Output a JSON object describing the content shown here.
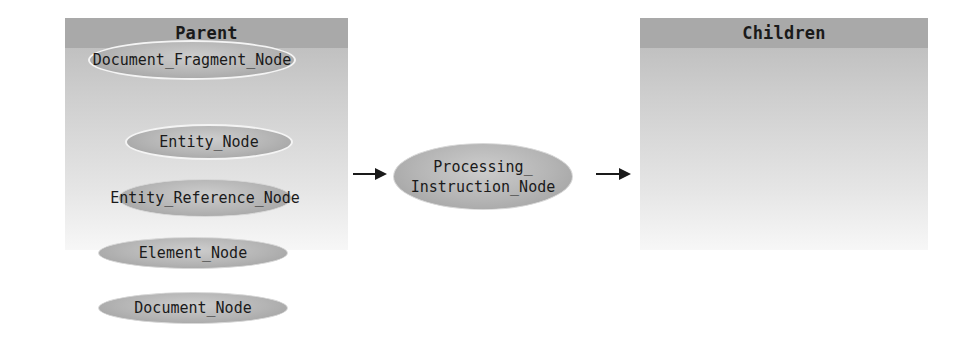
{
  "diagram": {
    "parent": {
      "title": "Parent",
      "nodes": [
        {
          "label": "Document_Fragment_Node",
          "outlined": true
        },
        {
          "label": "Entity_Node",
          "outlined": true
        },
        {
          "label": "Entity_Reference_Node",
          "outlined": false
        },
        {
          "label": "Element_Node",
          "outlined": false
        },
        {
          "label": "Document_Node",
          "outlined": false
        }
      ]
    },
    "center": {
      "line1": "Processing_",
      "line2": "Instruction_Node"
    },
    "children": {
      "title": "Children",
      "nodes": []
    },
    "edges": [
      {
        "from": "Parent",
        "to": "Processing_Instruction_Node"
      },
      {
        "from": "Processing_Instruction_Node",
        "to": "Children"
      }
    ],
    "colors": {
      "header": "#a9a9a9",
      "ellipse": "#b4b4b4",
      "outline": "#f4f4f4",
      "text": "#1a1a1a"
    }
  }
}
